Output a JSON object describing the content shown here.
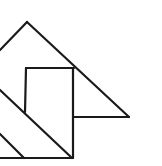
{
  "diagram": {
    "stroke_color": "#1a1a1a",
    "background": "#ffffff",
    "stroke_width": 2.2,
    "shapes": [
      {
        "name": "big-triangle-left-slope",
        "points": [
          [
            0,
            50
          ],
          [
            27,
            22
          ]
        ]
      },
      {
        "name": "big-triangle-right-slope",
        "points": [
          [
            27,
            22
          ],
          [
            129,
            117
          ]
        ]
      },
      {
        "name": "small-triangle-base",
        "points": [
          [
            73,
            117
          ],
          [
            129,
            117
          ]
        ]
      },
      {
        "name": "square-top",
        "points": [
          [
            26,
            68
          ],
          [
            74,
            68
          ]
        ]
      },
      {
        "name": "square-left",
        "points": [
          [
            26,
            68
          ],
          [
            25,
            112
          ]
        ]
      },
      {
        "name": "square-right",
        "points": [
          [
            73,
            68
          ],
          [
            73,
            158
          ]
        ]
      },
      {
        "name": "main-diagonal",
        "points": [
          [
            0,
            90
          ],
          [
            72,
            158
          ]
        ]
      },
      {
        "name": "lower-diagonal",
        "points": [
          [
            0,
            134
          ],
          [
            24,
            158
          ]
        ]
      },
      {
        "name": "bottom-edge",
        "points": [
          [
            0,
            158
          ],
          [
            73,
            158
          ]
        ]
      }
    ]
  }
}
